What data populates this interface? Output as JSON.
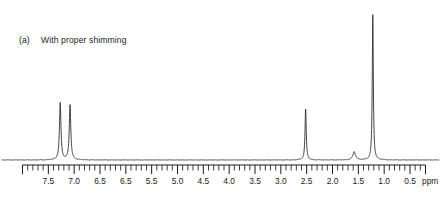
{
  "figure": {
    "caption_tag": "(a)",
    "caption_text": "With proper shimming"
  },
  "axis": {
    "unit": "ppm",
    "tick_labels": [
      "7.5",
      "7.0",
      "6.5",
      "6.5",
      "5.5",
      "5.0",
      "4.5",
      "4.0",
      "3.5",
      "3.0",
      "2.5",
      "2.0",
      "1.5",
      "1.0",
      "0.5"
    ],
    "left_ppm": 8.0,
    "right_ppm": 0.2,
    "minor_tick_step": 0.1,
    "major_tick_step": 0.5
  },
  "chart_data": {
    "type": "line",
    "title": "With proper shimming",
    "xlabel": "ppm",
    "ylabel": "",
    "xlim": [
      8.0,
      0.2
    ],
    "x_inverted": true,
    "grid": false,
    "legend": null,
    "ylim": [
      0,
      1
    ],
    "baseline_level": 0.0,
    "series": [
      {
        "name": "1H NMR spectrum",
        "peaks": [
          {
            "ppm": 7.27,
            "height": 0.375,
            "width": 0.035,
            "label": "aromatic doublet left"
          },
          {
            "ppm": 7.08,
            "height": 0.365,
            "width": 0.035,
            "label": "aromatic doublet right"
          },
          {
            "ppm": 2.52,
            "height": 0.335,
            "width": 0.028,
            "label": "methylene singlet"
          },
          {
            "ppm": 1.58,
            "height": 0.055,
            "width": 0.06,
            "label": "small broad residual"
          },
          {
            "ppm": 1.22,
            "height": 0.955,
            "width": 0.024,
            "label": "methyl singlet"
          }
        ]
      }
    ]
  },
  "colors": {
    "trace": "#303030",
    "axis": "#1b1b1b",
    "background": "#ffffff"
  }
}
